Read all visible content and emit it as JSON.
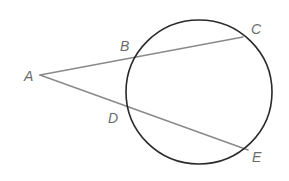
{
  "diagram": {
    "type": "secant-secant geometry figure",
    "circle": {
      "cx": 199,
      "cy": 92,
      "rx": 73,
      "ry": 72,
      "stroke": "#2a2a2a",
      "stroke_width": 1.6
    },
    "points": {
      "A": {
        "x": 40,
        "y": 75,
        "label": "A",
        "label_x": 24,
        "label_y": 69
      },
      "B": {
        "x": 135,
        "y": 58,
        "label": "B",
        "label_x": 120,
        "label_y": 39
      },
      "C": {
        "x": 243,
        "y": 37,
        "label": "C",
        "label_x": 251,
        "label_y": 22
      },
      "D": {
        "x": 126,
        "y": 113,
        "label": "D",
        "label_x": 108,
        "label_y": 111
      },
      "E": {
        "x": 248,
        "y": 150,
        "label": "E",
        "label_x": 252,
        "label_y": 150
      }
    },
    "segments": [
      {
        "from": "A",
        "to": "C",
        "through": "B"
      },
      {
        "from": "A",
        "to": "E",
        "through": "D"
      }
    ],
    "line_color": "#8a8a8a",
    "label_color": "#6b6b6b"
  }
}
